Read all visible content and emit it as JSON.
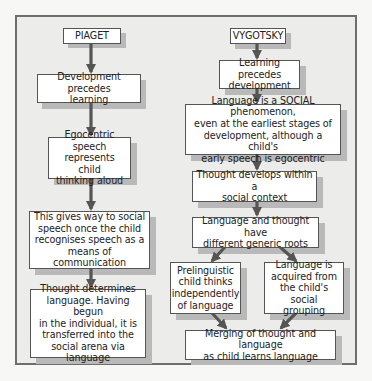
{
  "frame_color": "#ececeb",
  "arrow_color": "#555555",
  "piaget": {
    "heading": "PIAGET",
    "steps": [
      "Development precedes\nlearning",
      "Egocentric speech\nrepresents child\nthinking aloud",
      "This gives way to social\nspeech once the child\nrecognises speech as a\nmeans of communication",
      "Thought determines\nlanguage. Having begun\nin the individual, it is\ntransferred into the\nsocial arena via language"
    ]
  },
  "vygotsky": {
    "heading": "VYGOTSKY",
    "steps": [
      "Learning precedes\ndevelopment",
      "Language is a SOCIAL phenomenon,\neven at the earliest stages of\ndevelopment, although a child's\nearly speech is egocentric",
      "Thought develops within a\nsocial context",
      "Language and thought have\ndifferent generic roots"
    ],
    "branches": [
      "Prelinguistic\nchild thinks\nindependently\nof language",
      "Language is\nacquired from\nthe child's social\ngrouping"
    ],
    "merge": "Merging of thought and language\nas child learns language"
  }
}
